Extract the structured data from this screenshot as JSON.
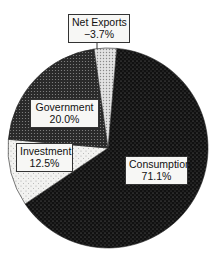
{
  "chart_data": {
    "type": "pie",
    "title": "",
    "slices": [
      {
        "label": "Consumption",
        "value": 71.1,
        "display": "71.1%"
      },
      {
        "label": "Investment",
        "value": 12.5,
        "display": "12.5%"
      },
      {
        "label": "Government",
        "value": 20.0,
        "display": "20.0%"
      },
      {
        "label": "Net Exports",
        "value": -3.7,
        "display": "−3.7%"
      }
    ],
    "categories": [
      "Consumption",
      "Investment",
      "Government",
      "Net Exports"
    ],
    "values": [
      71.1,
      12.5,
      20.0,
      -3.7
    ],
    "legend": "none (labels on slices)",
    "units": "percent"
  },
  "labels": {
    "net_exports": {
      "name": "Net Exports",
      "value": "−3.7%"
    },
    "government": {
      "name": "Government",
      "value": "20.0%"
    },
    "investment": {
      "name": "Investment",
      "value": "12.5%"
    },
    "consumption": {
      "name": "Consumption",
      "value": "71.1%"
    }
  }
}
